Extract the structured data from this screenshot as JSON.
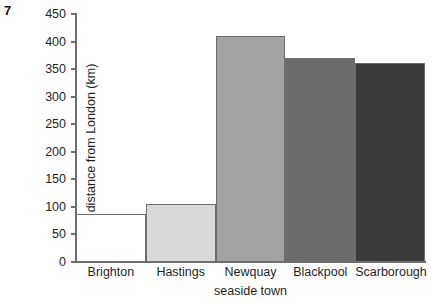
{
  "question_number": "7",
  "chart_data": {
    "type": "bar",
    "title": "",
    "xlabel": "seaside town",
    "ylabel": "distance from London (km)",
    "categories": [
      "Brighton",
      "Hastings",
      "Newquay",
      "Blackpool",
      "Scarborough"
    ],
    "values": [
      87,
      105,
      411,
      370,
      361
    ],
    "series": [
      {
        "name": "distance from London (km)",
        "values": [
          87,
          105,
          411,
          370,
          361
        ]
      }
    ],
    "bar_colors": [
      "#ffffff",
      "#d9d9d9",
      "#a3a3a3",
      "#6b6b6b",
      "#3b3b3b"
    ],
    "bar_edge_color": "#6e6e6e",
    "ylim": [
      0,
      450
    ],
    "yticks": [
      0,
      50,
      100,
      150,
      200,
      250,
      300,
      350,
      400,
      450
    ],
    "ytick_labels": [
      "0",
      "50",
      "100",
      "150",
      "200",
      "250",
      "300",
      "350",
      "400",
      "450"
    ],
    "grid": false,
    "legend": false,
    "legend_position": "none"
  }
}
